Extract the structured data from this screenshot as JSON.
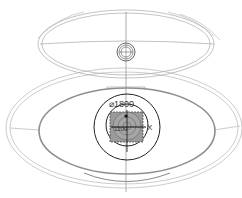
{
  "diagram": {
    "type": "technical-drawing",
    "labels": {
      "diameter": "⌀1800",
      "center_value": "1200",
      "axis_x": "X"
    },
    "colors": {
      "background": "#ffffff",
      "thin_line": "#9a9a9a",
      "thick_line": "#8c8c8c",
      "dark_line": "#222222",
      "fill_gray": "#9b9b9b"
    }
  }
}
